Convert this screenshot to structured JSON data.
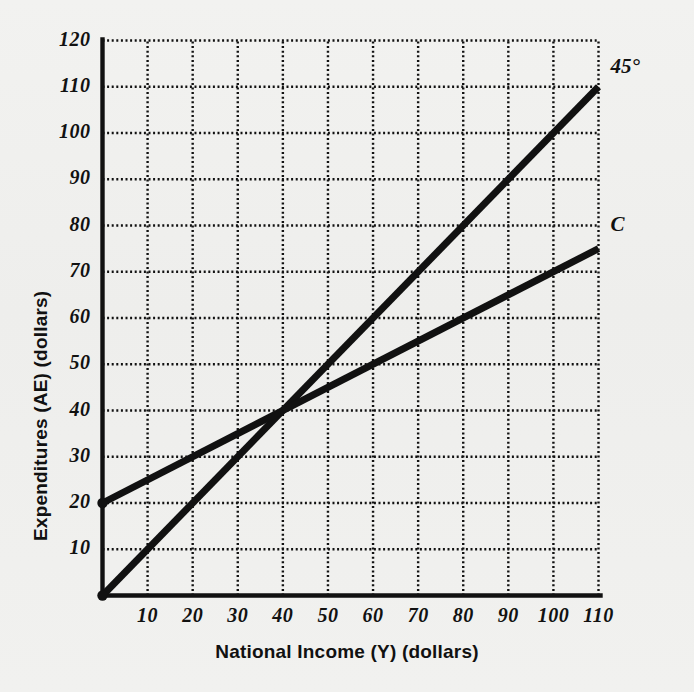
{
  "figure": {
    "background_color": "#f0f0ee",
    "ink_color": "#111111"
  },
  "chart_data": {
    "type": "line",
    "title": "",
    "xlabel": "National Income (Y) (dollars)",
    "ylabel": "Expenditures (AE) (dollars)",
    "xlim": [
      0,
      110
    ],
    "ylim": [
      0,
      120
    ],
    "xticks": [
      10,
      20,
      30,
      40,
      50,
      60,
      70,
      80,
      90,
      100,
      110
    ],
    "yticks": [
      10,
      20,
      30,
      40,
      50,
      60,
      70,
      80,
      90,
      100,
      110,
      120
    ],
    "xtick_labels": [
      "10",
      "20",
      "30",
      "40",
      "50",
      "60",
      "70",
      "80",
      "90",
      "100",
      "110"
    ],
    "ytick_labels": [
      "10",
      "20",
      "30",
      "40",
      "50",
      "60",
      "70",
      "80",
      "90",
      "100",
      "110",
      "120"
    ],
    "grid": true,
    "grid_style": "dotted",
    "legend": "none",
    "annotations": [
      {
        "text": "45°",
        "x": 110,
        "y": 114
      },
      {
        "text": "C",
        "x": 110,
        "y": 80
      }
    ],
    "series": [
      {
        "name": "45°",
        "label": "45°",
        "intercept": 0,
        "slope": 1,
        "x": [
          0,
          110
        ],
        "values": [
          0,
          110
        ],
        "color": "#111111",
        "width": 7
      },
      {
        "name": "C",
        "label": "C",
        "intercept": 20,
        "slope": 0.5,
        "x": [
          0,
          110
        ],
        "values": [
          20,
          75
        ],
        "color": "#111111",
        "width": 7
      }
    ],
    "markers": [
      {
        "series": "C",
        "x": 0,
        "y": 20
      },
      {
        "series": "45°",
        "x": 0,
        "y": 0
      }
    ],
    "intersection": {
      "x": 40,
      "y": 40
    }
  }
}
